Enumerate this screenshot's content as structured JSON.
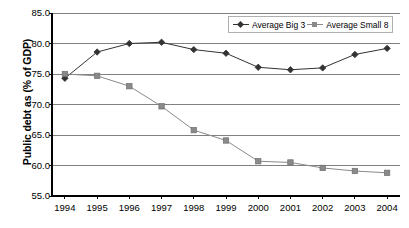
{
  "chart_data": {
    "type": "line",
    "title": "",
    "xlabel": "",
    "ylabel": "Public debt as (% of GDP)",
    "categories": [
      "1994",
      "1995",
      "1996",
      "1997",
      "1998",
      "1999",
      "2000",
      "2001",
      "2002",
      "2003",
      "2004"
    ],
    "x": [
      1994,
      1995,
      1996,
      1997,
      1998,
      1999,
      2000,
      2001,
      2002,
      2003,
      2004
    ],
    "xlim": [
      1993.6,
      2004.4
    ],
    "ylim": [
      55.0,
      85.0
    ],
    "yticks": [
      "85.0",
      "80.0",
      "75.0",
      "70.0",
      "65.0",
      "60.0",
      "55.0"
    ],
    "ytick_values": [
      85.0,
      80.0,
      75.0,
      70.0,
      65.0,
      60.0,
      55.0
    ],
    "grid": "horizontal",
    "legend_position": "top-right",
    "series": [
      {
        "name": "Average Big 3",
        "marker": "diamond",
        "color": "#333333",
        "values": [
          74.3,
          78.6,
          80.0,
          80.2,
          79.0,
          78.4,
          76.1,
          75.7,
          76.0,
          78.2,
          79.2
        ]
      },
      {
        "name": "Average Small 8",
        "marker": "square",
        "color": "#8a8a8a",
        "values": [
          75.0,
          74.7,
          73.0,
          69.7,
          65.8,
          64.1,
          60.7,
          60.5,
          59.6,
          59.1,
          58.8
        ]
      }
    ]
  },
  "axis_colors": {
    "gridline": "#808080",
    "axis": "#000000",
    "plot_border": "#808080"
  }
}
